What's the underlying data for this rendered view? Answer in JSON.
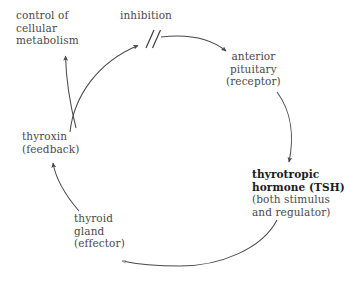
{
  "diagram": {
    "type": "cycle-diagram",
    "background_color": "#ffffff",
    "line_color": "#4a4a4a",
    "text_color": "#4a4a4a",
    "emphasis_text_color": "#1c1c1c",
    "nodes": {
      "control_metabolism": {
        "lines": [
          "control of",
          "cellular",
          "metabolism"
        ],
        "line1": "control of",
        "line2": "cellular",
        "line3": "metabolism"
      },
      "inhibition": {
        "label": "inhibition"
      },
      "anterior_pituitary": {
        "lines": [
          "anterior",
          "pituitary",
          "(receptor)"
        ],
        "line1": "anterior",
        "line2": "pituitary",
        "line3": "(receptor)"
      },
      "tsh": {
        "lines": [
          "thyrotropic",
          "hormone (TSH)",
          "(both stimulus",
          "and regulator)"
        ],
        "line1": "thyrotropic",
        "line2": "hormone (TSH)",
        "line3": "(both stimulus",
        "line4": "and regulator)",
        "emphasis": "bold"
      },
      "thyroid_gland": {
        "lines": [
          "thyroid",
          "gland",
          "(effector)"
        ],
        "line1": "thyroid",
        "line2": "gland",
        "line3": "(effector)"
      },
      "thyroxin": {
        "lines": [
          "thyroxin",
          "(feedback)"
        ],
        "line1": "thyroxin",
        "line2": "(feedback)"
      }
    },
    "edges": [
      {
        "name": "inhibition-arc",
        "from": "thyroxin",
        "to": "inhibition-point",
        "arrowhead": "left",
        "symbol": "double-slash-inhibition"
      },
      {
        "name": "inhibition-to-pituitary-arc",
        "from": "inhibition-point",
        "to": "anterior_pituitary",
        "arrowhead": "right"
      },
      {
        "name": "pituitary-to-tsh-arc",
        "from": "anterior_pituitary",
        "to": "tsh",
        "arrowhead": "down"
      },
      {
        "name": "tsh-to-thyroid-arc",
        "from": "tsh",
        "to": "thyroid_gland",
        "arrowhead": "left"
      },
      {
        "name": "thyroid-to-thyroxin-arc",
        "from": "thyroid_gland",
        "to": "thyroxin",
        "arrowhead": "up"
      },
      {
        "name": "thyroxin-to-metabolism-arc",
        "from": "thyroxin",
        "to": "control_metabolism",
        "arrowhead": "up"
      }
    ]
  }
}
